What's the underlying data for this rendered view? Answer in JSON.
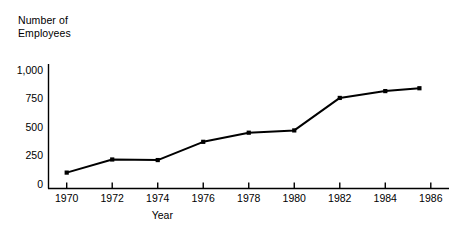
{
  "chart_data": {
    "type": "line",
    "title": "",
    "xlabel": "Year",
    "ylabel": "Number of\nEmployees",
    "x": [
      1970,
      1972,
      1974,
      1976,
      1978,
      1980,
      1982,
      1984,
      1985.5
    ],
    "values": [
      100,
      215,
      210,
      370,
      450,
      470,
      755,
      815,
      840
    ],
    "series": [
      {
        "name": "Number of Employees",
        "x": [
          1970,
          1972,
          1974,
          1976,
          1978,
          1980,
          1982,
          1984,
          1985.5
        ],
        "values": [
          100,
          215,
          210,
          370,
          450,
          470,
          755,
          815,
          840
        ]
      }
    ],
    "xlim": [
      1969.2,
      1986.8
    ],
    "ylim": [
      0,
      1100
    ],
    "x_ticks": [
      1970,
      1972,
      1974,
      1976,
      1978,
      1980,
      1982,
      1984,
      1986
    ],
    "x_tick_labels": [
      "1970",
      "1972",
      "1974",
      "1976",
      "1978",
      "1980",
      "1982",
      "1984",
      "1986"
    ],
    "y_ticks": [
      0,
      250,
      500,
      750,
      1000
    ],
    "y_tick_labels": [
      "0",
      "250",
      "500",
      "750",
      "1,000"
    ],
    "grid": false,
    "legend": false,
    "marker": "square-dot",
    "line_color": "#000000",
    "marker_color": "#000000",
    "axis_color": "#000000",
    "background_color": "#ffffff"
  }
}
